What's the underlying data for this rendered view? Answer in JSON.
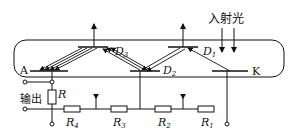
{
  "diagram": {
    "incident_light_label": "入射光",
    "output_label": "输出",
    "anode_label": "A",
    "cathode_label": "K",
    "dynodes": [
      {
        "name": "D",
        "sub": "1"
      },
      {
        "name": "D",
        "sub": "2"
      },
      {
        "name": "D",
        "sub": "3"
      }
    ],
    "load_resistor": {
      "name": "R"
    },
    "resistors": [
      {
        "name": "R",
        "sub": "4"
      },
      {
        "name": "R",
        "sub": "3"
      },
      {
        "name": "R",
        "sub": "2"
      },
      {
        "name": "R",
        "sub": "1"
      }
    ]
  }
}
